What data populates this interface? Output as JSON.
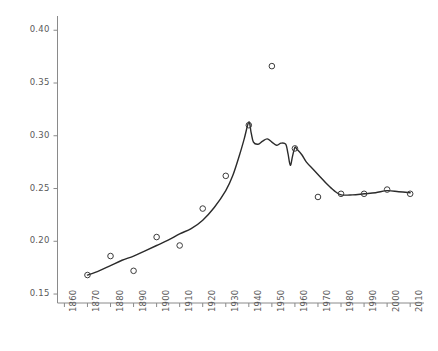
{
  "chart_data": {
    "type": "line",
    "title": "",
    "subtitle": "",
    "xlabel": "",
    "ylabel": "",
    "grid": false,
    "legend": "none",
    "xlim": [
      1857,
      2016
    ],
    "ylim": [
      0.1415,
      0.4135
    ],
    "x_ticks": [
      1860,
      1870,
      1880,
      1890,
      1900,
      1910,
      1920,
      1930,
      1940,
      1950,
      1960,
      1970,
      1980,
      1990,
      2000,
      2010
    ],
    "x_tick_labels": [
      "1860",
      "1870",
      "1880",
      "1890",
      "1900",
      "1910",
      "1920",
      "1930",
      "1940",
      "1950",
      "1960",
      "1970",
      "1980",
      "1990",
      "2000",
      "2010"
    ],
    "y_ticks": [
      0.15,
      0.2,
      0.25,
      0.3,
      0.35,
      0.4
    ],
    "y_tick_labels": [
      "0.15",
      "0.20",
      "0.25",
      "0.30",
      "0.35",
      "0.40"
    ],
    "series": [
      {
        "name": "markers",
        "style": "scatter",
        "marker": "open-circle",
        "color": "#3c3c3c",
        "x": [
          1870,
          1880,
          1890,
          1900,
          1910,
          1920,
          1930,
          1940,
          1950,
          1960,
          1970,
          1980,
          1990,
          2000,
          2010
        ],
        "values": [
          0.168,
          0.186,
          0.172,
          0.204,
          0.196,
          0.231,
          0.262,
          0.31,
          0.366,
          0.288,
          0.242,
          0.245,
          0.245,
          0.249,
          0.245
        ]
      },
      {
        "name": "smoothed-curve",
        "style": "line",
        "color": "#2b2b2b",
        "x": [
          1870,
          1875,
          1880,
          1885,
          1890,
          1895,
          1900,
          1905,
          1910,
          1915,
          1920,
          1925,
          1930,
          1933,
          1936,
          1938,
          1940,
          1941,
          1942,
          1944,
          1946,
          1948,
          1950,
          1952,
          1954,
          1956,
          1957,
          1958,
          1959,
          1960,
          1961,
          1963,
          1965,
          1968,
          1971,
          1974,
          1977,
          1980,
          1985,
          1990,
          1995,
          2000,
          2005,
          2010
        ],
        "values": [
          0.168,
          0.172,
          0.177,
          0.182,
          0.186,
          0.191,
          0.196,
          0.201,
          0.207,
          0.212,
          0.22,
          0.232,
          0.248,
          0.262,
          0.282,
          0.297,
          0.313,
          0.303,
          0.294,
          0.292,
          0.295,
          0.297,
          0.294,
          0.291,
          0.293,
          0.292,
          0.283,
          0.272,
          0.281,
          0.289,
          0.287,
          0.282,
          0.275,
          0.268,
          0.261,
          0.254,
          0.248,
          0.244,
          0.244,
          0.245,
          0.246,
          0.248,
          0.247,
          0.246
        ]
      }
    ]
  },
  "axes": {
    "line_color": "#8a8a8a",
    "tick_color": "#8a8a8a",
    "label_color": "#5a5a5a",
    "background": "#ffffff"
  }
}
